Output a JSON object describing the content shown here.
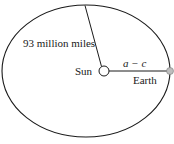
{
  "diagram": {
    "labels": {
      "distance": "93 million miles",
      "sun": "Sun",
      "perihelion": "a − c",
      "earth": "Earth"
    },
    "colors": {
      "stroke": "#1a1a1a",
      "sun_fill": "#ffffff",
      "earth_fill": "#bdbdbd"
    }
  }
}
